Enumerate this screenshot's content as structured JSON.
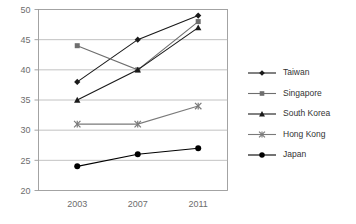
{
  "chart_data": {
    "type": "line",
    "title": "",
    "xlabel": "",
    "ylabel": "",
    "categories": [
      "2003",
      "2007",
      "2011"
    ],
    "x_tick_labels": [
      "2003",
      "2007",
      "2011"
    ],
    "y_tick_labels": [
      "20",
      "25",
      "30",
      "35",
      "40",
      "45",
      "50"
    ],
    "y_ticks": [
      20,
      25,
      30,
      35,
      40,
      45,
      50
    ],
    "ylim": [
      20,
      50
    ],
    "grid": true,
    "legend_position": "right",
    "series": [
      {
        "name": "Taiwan",
        "marker": "diamond",
        "color": "#1a1a1a",
        "values": [
          38,
          45,
          49
        ]
      },
      {
        "name": "Singapore",
        "marker": "square",
        "color": "#6e6e6e",
        "values": [
          44,
          40,
          48
        ]
      },
      {
        "name": "South Korea",
        "marker": "triangle",
        "color": "#1a1a1a",
        "values": [
          35,
          40,
          47
        ]
      },
      {
        "name": "Hong Kong",
        "marker": "cross",
        "color": "#7a7a7a",
        "values": [
          31,
          31,
          34
        ]
      },
      {
        "name": "Japan",
        "marker": "circle",
        "color": "#000000",
        "values": [
          24,
          26,
          27
        ]
      }
    ]
  },
  "legend": {
    "items": [
      {
        "label": "Taiwan"
      },
      {
        "label": "Singapore"
      },
      {
        "label": "South Korea"
      },
      {
        "label": "Hong Kong"
      },
      {
        "label": "Japan"
      }
    ]
  },
  "axes": {
    "y_labels": [
      "50",
      "45",
      "40",
      "35",
      "30",
      "25",
      "20"
    ],
    "x_labels": [
      "2003",
      "2007",
      "2011"
    ]
  },
  "colors": {
    "grid": "#b3b3b3",
    "frame": "#9a9a9a",
    "axis_text": "#6d6d6d",
    "legend_text": "#333333"
  }
}
